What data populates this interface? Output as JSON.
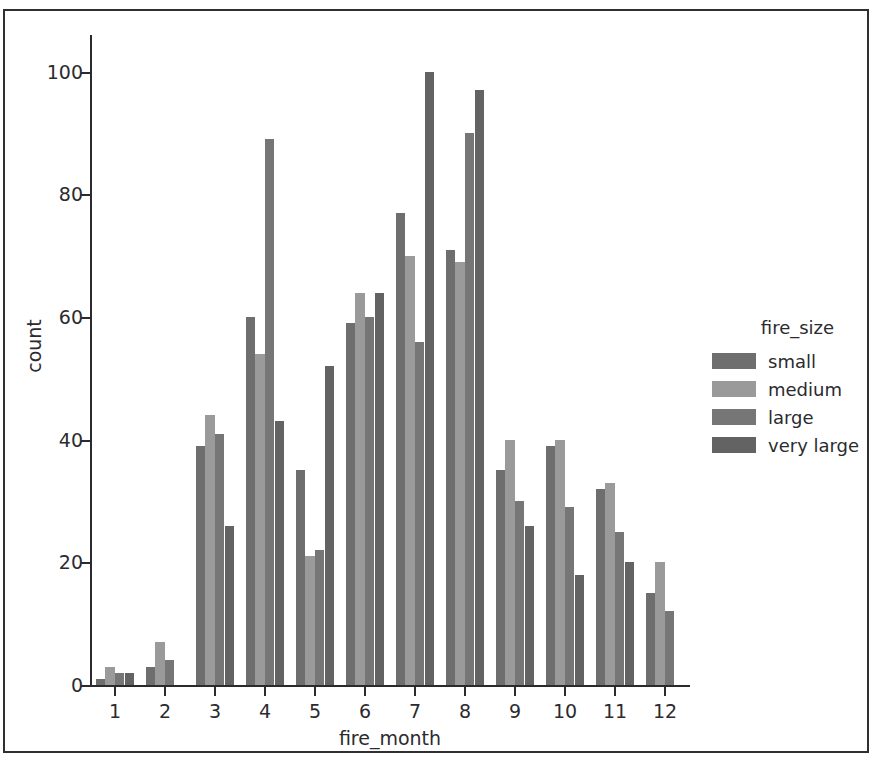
{
  "figure": {
    "top_sliver_text": "······",
    "background": "#ffffff",
    "frame_color": "#2f2f33"
  },
  "chart_data": {
    "type": "bar",
    "title": "",
    "subtitle": "",
    "xlabel": "fire_month",
    "ylabel": "count",
    "categories": [
      "1",
      "2",
      "3",
      "4",
      "5",
      "6",
      "7",
      "8",
      "9",
      "10",
      "11",
      "12"
    ],
    "series": [
      {
        "name": "small",
        "color": "#6e6e6e",
        "values": [
          1,
          3,
          39,
          60,
          35,
          59,
          77,
          71,
          35,
          39,
          32,
          15
        ]
      },
      {
        "name": "medium",
        "color": "#9a9a9a",
        "values": [
          3,
          7,
          44,
          54,
          21,
          64,
          70,
          69,
          40,
          40,
          33,
          20
        ]
      },
      {
        "name": "large",
        "color": "#767676",
        "values": [
          2,
          4,
          41,
          89,
          22,
          60,
          56,
          90,
          30,
          29,
          25,
          12
        ]
      },
      {
        "name": "very large",
        "color": "#636363",
        "values": [
          2,
          0,
          26,
          43,
          52,
          64,
          100,
          97,
          26,
          18,
          20,
          0
        ]
      }
    ],
    "ylim": [
      0,
      106
    ],
    "yticks": [
      0,
      20,
      40,
      60,
      80,
      100
    ],
    "ytick_labels": [
      "0",
      "20",
      "40",
      "60",
      "80",
      "100"
    ],
    "xtick_labels": [
      "1",
      "2",
      "3",
      "4",
      "5",
      "6",
      "7",
      "8",
      "9",
      "10",
      "11",
      "12"
    ],
    "grid": false,
    "legend_position": "right-outside",
    "legend_title": "fire_size",
    "axis_color": "#2b2b2f"
  },
  "legend": {
    "title": "fire_size",
    "entries": [
      {
        "label": "small",
        "color": "#6e6e6e"
      },
      {
        "label": "medium",
        "color": "#9a9a9a"
      },
      {
        "label": "large",
        "color": "#767676"
      },
      {
        "label": "very large",
        "color": "#636363"
      }
    ]
  }
}
